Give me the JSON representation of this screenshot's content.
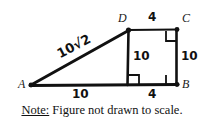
{
  "figure": {
    "type": "geometry-diagram",
    "vertices": [
      {
        "id": "A",
        "label": "A",
        "x": 32,
        "y": 85
      },
      {
        "id": "B",
        "label": "B",
        "x": 176,
        "y": 84
      },
      {
        "id": "C",
        "label": "C",
        "x": 176,
        "y": 30
      },
      {
        "id": "D",
        "label": "D",
        "x": 128,
        "y": 30
      }
    ],
    "segments": [
      {
        "name": "hypotenuse-AD",
        "from": "A",
        "to": "D",
        "label": "10√2"
      },
      {
        "name": "top-DC",
        "from": "D",
        "to": "C",
        "label": "4"
      },
      {
        "name": "right-CB",
        "from": "C",
        "to": "B",
        "label": "10"
      },
      {
        "name": "base-AB",
        "from": "A",
        "to": "B",
        "label": null
      },
      {
        "name": "interior-vertical-DE",
        "from": "D",
        "to": "E",
        "label": "10"
      }
    ],
    "labels": {
      "hypotenuse": "10√2",
      "top": "4",
      "right": "10",
      "interior_vertical": "10",
      "base_left": "10",
      "base_right": "4"
    },
    "right_angles": [
      {
        "name": "right-angle-at-C",
        "x": 176,
        "y": 30
      },
      {
        "name": "right-angle-at-foot-of-D",
        "x": 128,
        "y": 84
      },
      {
        "name": "right-angle-at-B",
        "x": 176,
        "y": 84
      }
    ],
    "stroke_color": "#111111"
  },
  "note": {
    "prefix": "Note:",
    "text": "Figure not drawn to scale."
  }
}
